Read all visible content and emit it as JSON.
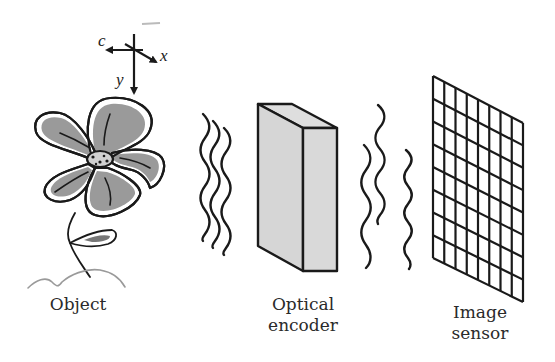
{
  "diagram": {
    "axes": {
      "c_label": "c",
      "x_label": "x",
      "y_label": "y"
    },
    "labels": {
      "object": "Object",
      "optical_encoder_line1": "Optical",
      "optical_encoder_line2": "encoder",
      "image_sensor_line1": "Image",
      "image_sensor_line2": "sensor"
    },
    "components": [
      {
        "name": "object",
        "icon": "flower-icon"
      },
      {
        "name": "incoming-light",
        "icon": "wave-icon",
        "count": 3
      },
      {
        "name": "optical-encoder",
        "icon": "box-icon"
      },
      {
        "name": "outgoing-light",
        "icon": "wave-icon",
        "count": 3
      },
      {
        "name": "image-sensor",
        "icon": "grid-icon",
        "rows": 8,
        "columns": 8
      }
    ],
    "colors": {
      "stroke": "#1a1a1a",
      "petal_fill": "#9a9a9a",
      "encoder_fill": "#d9d9d9",
      "background": "#ffffff"
    }
  }
}
